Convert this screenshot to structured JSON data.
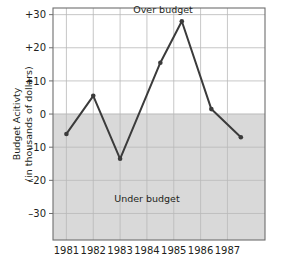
{
  "chart_data": {
    "type": "line",
    "title": "",
    "xlabel": "",
    "ylabel_line1": "Budget Acitivty",
    "ylabel_line2": "(in thousands of dollars)",
    "x": [
      1981.0,
      1982.0,
      1983.0,
      1984.5,
      1985.3,
      1986.4,
      1987.5
    ],
    "values": [
      -6,
      5.5,
      -13.5,
      15.5,
      28,
      1.5,
      -7
    ],
    "point_labels": [
      "1981",
      "1982",
      "1983",
      "1984",
      "1985",
      "1986",
      "1987"
    ],
    "xtick_labels": [
      "1981",
      "1982",
      "1983",
      "1984",
      "1985",
      "1986",
      "1987"
    ],
    "xticks": [
      1981,
      1982,
      1983,
      1984,
      1985,
      1986,
      1987
    ],
    "ytick_labels": [
      "+30",
      "+20",
      "+10",
      "0",
      "–10",
      "–20",
      "–30"
    ],
    "yticks": [
      30,
      20,
      10,
      0,
      -10,
      -20,
      -30
    ],
    "ylim": [
      -38,
      32
    ],
    "xlim": [
      1980.5,
      1988.4
    ],
    "grid": true,
    "legend": "none",
    "annotations": [
      {
        "text": "Over budget",
        "x": 1984.6,
        "y": 30.5
      },
      {
        "text": "Under budget",
        "x": 1984.0,
        "y": -26.5
      }
    ],
    "shaded_region": {
      "label": "Under budget",
      "from": 0,
      "to": -38,
      "color": "#d9d9d9"
    },
    "series_color": "#3b3b3b",
    "grid_color": "#b9b9b9",
    "axis_color": "#6e6e6e",
    "plot_background": "#ffffff"
  }
}
